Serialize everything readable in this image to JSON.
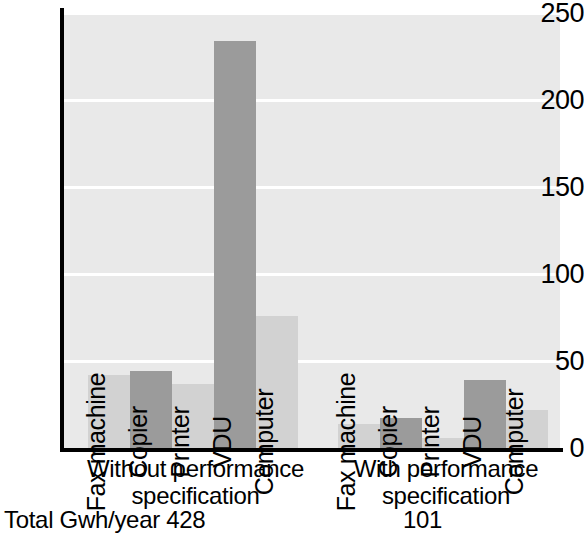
{
  "chart_data": {
    "type": "bar",
    "title": "",
    "xlabel": "",
    "ylabel": "",
    "ylim": [
      0,
      250
    ],
    "yticks": [
      0,
      50,
      100,
      150,
      200,
      250
    ],
    "grid": true,
    "legend": "none",
    "categories": [
      "Fax machine",
      "Copier",
      "Printer",
      "VDU",
      "Computer"
    ],
    "series": [
      {
        "name": "Without performance specification",
        "values": [
          42,
          44,
          37,
          234,
          76
        ],
        "total_label": "Total Gwh/year  428",
        "total": 428
      },
      {
        "name": "With performance specification",
        "values": [
          14,
          17,
          6,
          39,
          22
        ],
        "total_label": "101",
        "total": 101
      }
    ],
    "bar_colors": [
      "#d2d2d2",
      "#9b9b9b",
      "#d2d2d2",
      "#9b9b9b",
      "#d2d2d2"
    ],
    "plot_background": "#e9e9e9",
    "gridline_color": "#ffffff",
    "axis_color": "#000000"
  },
  "axis": {
    "ticks": [
      {
        "value": 250,
        "label": "250"
      },
      {
        "value": 200,
        "label": "200"
      },
      {
        "value": 150,
        "label": "150"
      },
      {
        "value": 100,
        "label": "100"
      },
      {
        "value": 50,
        "label": "50"
      },
      {
        "value": 0,
        "label": "0"
      }
    ]
  },
  "groups": [
    {
      "id": "without-performance-specification",
      "caption_line1": "Without performance",
      "caption_line2": "specification",
      "total_text": "Total Gwh/year  428",
      "bars": [
        {
          "label": "Fax machine",
          "value": 42
        },
        {
          "label": "Copier",
          "value": 44
        },
        {
          "label": "Printer",
          "value": 37
        },
        {
          "label": "VDU",
          "value": 234
        },
        {
          "label": "Computer",
          "value": 76
        }
      ]
    },
    {
      "id": "with-performance-specification",
      "caption_line1": "With performance",
      "caption_line2": "specification",
      "total_text": "101",
      "bars": [
        {
          "label": "Fax machine",
          "value": 14
        },
        {
          "label": "Copier",
          "value": 17
        },
        {
          "label": "Printer",
          "value": 6
        },
        {
          "label": "VDU",
          "value": 39
        },
        {
          "label": "Computer",
          "value": 22
        }
      ]
    }
  ]
}
